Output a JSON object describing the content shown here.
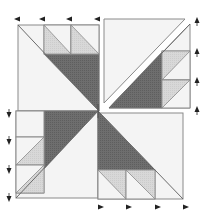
{
  "diagram": {
    "colors": {
      "background": "#ffffff",
      "light": "#f4f4f4",
      "medium": "#d6d6d6",
      "dark": "#6b6b6b",
      "stroke": "#8a8a8a",
      "arrow": "#222222"
    },
    "quadrants": [
      {
        "id": "top-left",
        "description": "Square with dark trapezoid and two light half-square triangle units along top edge"
      },
      {
        "id": "top-right",
        "description": "Square split diagonally with gap; dark triangle with two half-square triangle units along right edge"
      },
      {
        "id": "bottom-left",
        "description": "Square with dark trapezoid and two half-square triangle units along left edge"
      },
      {
        "id": "bottom-right",
        "description": "Square with dark trapezoid and two half-square triangle units along bottom edge"
      }
    ],
    "arrows": {
      "top": {
        "direction": "left",
        "count": 4
      },
      "right": {
        "direction": "up",
        "count": 4
      },
      "left": {
        "direction": "down",
        "count": 4
      },
      "bottom": {
        "direction": "right",
        "count": 4
      }
    }
  }
}
